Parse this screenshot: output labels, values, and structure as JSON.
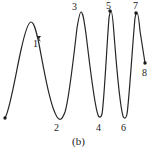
{
  "figure": {
    "caption": "(b)",
    "caption_x": 72,
    "caption_y": 136,
    "width": 159,
    "height": 152,
    "background": "#ffffff",
    "stroke_color": "#262626",
    "stroke_width": 1.2,
    "marker_color": "#1a1a1a"
  },
  "chart_data": {
    "type": "line",
    "title": "",
    "subtitle": "",
    "xlabel": "",
    "ylabel": "",
    "grid": false,
    "legend": null,
    "axes_visible": false,
    "x": [
      5,
      31,
      57,
      80,
      99,
      110,
      124,
      136,
      145
    ],
    "y": [
      118,
      22,
      118,
      12,
      117,
      11,
      118,
      13,
      63
    ],
    "xlim": [
      0,
      159
    ],
    "ylim": [
      152,
      0
    ],
    "points": [
      {
        "id": "start",
        "label": "",
        "x": 5,
        "y": 118,
        "kind": "endpoint",
        "marker": true,
        "label_x": 0,
        "label_y": 0
      },
      {
        "id": "p1",
        "label": "1",
        "x": 31,
        "y": 22,
        "kind": "peak",
        "marker": false,
        "label_x": 33,
        "label_y": 39
      },
      {
        "id": "p2",
        "label": "2",
        "x": 57,
        "y": 118,
        "kind": "trough",
        "marker": false,
        "label_x": 54,
        "label_y": 123
      },
      {
        "id": "p3",
        "label": "3",
        "x": 80,
        "y": 12,
        "kind": "peak",
        "marker": false,
        "label_x": 72,
        "label_y": 2
      },
      {
        "id": "p4",
        "label": "4",
        "x": 99,
        "y": 117,
        "kind": "trough",
        "marker": false,
        "label_x": 96,
        "label_y": 123
      },
      {
        "id": "p5",
        "label": "5",
        "x": 110,
        "y": 11,
        "kind": "peak",
        "marker": true,
        "label_x": 106,
        "label_y": 1
      },
      {
        "id": "p6",
        "label": "6",
        "x": 124,
        "y": 118,
        "kind": "trough",
        "marker": false,
        "label_x": 121,
        "label_y": 123
      },
      {
        "id": "p7",
        "label": "7",
        "x": 136,
        "y": 13,
        "kind": "peak",
        "marker": true,
        "label_x": 133,
        "label_y": 1
      },
      {
        "id": "p8",
        "label": "8",
        "x": 145,
        "y": 63,
        "kind": "endpoint",
        "marker": true,
        "label_x": 142,
        "label_y": 68
      }
    ],
    "path": "M 5,118 C 10,110 16,72 21,50 C 25,32 28,22 31,22 C 34,22 36,30 39,44 C 44,70 50,106 57,117 C 60,121 62,120 65,112 C 69,100 74,54 77,28 C 79,16 80,12 81,12 C 83,12 84,20 86,34 C 89,58 94,104 98,115 C 99,118 101,118 102,114 C 104,104 107,42 109,18 C 110,12 110,11 111,11 C 112,11 113,20 114,34 C 116,60 120,106 123,116 C 124,119 126,119 127,114 C 129,102 133,38 135,18 C 136,13 136,13 137,13 C 138,13 139,20 140,31 C 142,44 144,57 145,63"
  }
}
